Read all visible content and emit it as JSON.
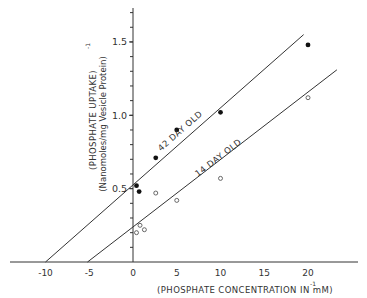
{
  "chart_data": {
    "type": "scatter",
    "title": "",
    "xlabel": "(PHOSPHATE CONCENTRATION IN mM)",
    "xlabel_superscript": "-1",
    "ylabel": "(PHOSPHATE UPTAKE)",
    "ylabel_superscript": "-1",
    "ylabel_sub": "(Nanomoles/mg Vesicle Protein)",
    "xlim": [
      -14,
      26
    ],
    "ylim": [
      0,
      1.75
    ],
    "x_ticks": [
      -10,
      -5,
      0,
      5,
      10,
      15,
      20
    ],
    "x_tick_labels": [
      "-10",
      "-5",
      "0",
      "5",
      "10",
      "15",
      "20"
    ],
    "y_ticks": [
      0.5,
      1.0,
      1.5
    ],
    "y_tick_labels": [
      "0.5",
      "1.0",
      "1.5"
    ],
    "y_minor_step": 0.1,
    "grid": false,
    "series": [
      {
        "name": "42 DAY OLD",
        "marker": "filled-circle",
        "points": [
          {
            "x": 0.4,
            "y": 0.52
          },
          {
            "x": 0.7,
            "y": 0.48
          },
          {
            "x": 2.6,
            "y": 0.71
          },
          {
            "x": 5.0,
            "y": 0.9
          },
          {
            "x": 10.0,
            "y": 1.02
          },
          {
            "x": 20.0,
            "y": 1.48
          }
        ],
        "fit_line": {
          "x_start": -10,
          "y_start": 0,
          "x_end": 19.5,
          "y_end": 1.55
        },
        "line_label": "42 DAY OLD"
      },
      {
        "name": "14 DAY OLD",
        "marker": "open-circle",
        "points": [
          {
            "x": 0.4,
            "y": 0.2
          },
          {
            "x": 0.8,
            "y": 0.25
          },
          {
            "x": 1.3,
            "y": 0.22
          },
          {
            "x": 2.6,
            "y": 0.47
          },
          {
            "x": 5.0,
            "y": 0.42
          },
          {
            "x": 10.0,
            "y": 0.57
          },
          {
            "x": 20.0,
            "y": 1.12
          }
        ],
        "fit_line": {
          "x_start": -5.2,
          "y_start": 0,
          "x_end": 23.3,
          "y_end": 1.31
        },
        "line_label": "14 DAY OLD"
      }
    ]
  }
}
